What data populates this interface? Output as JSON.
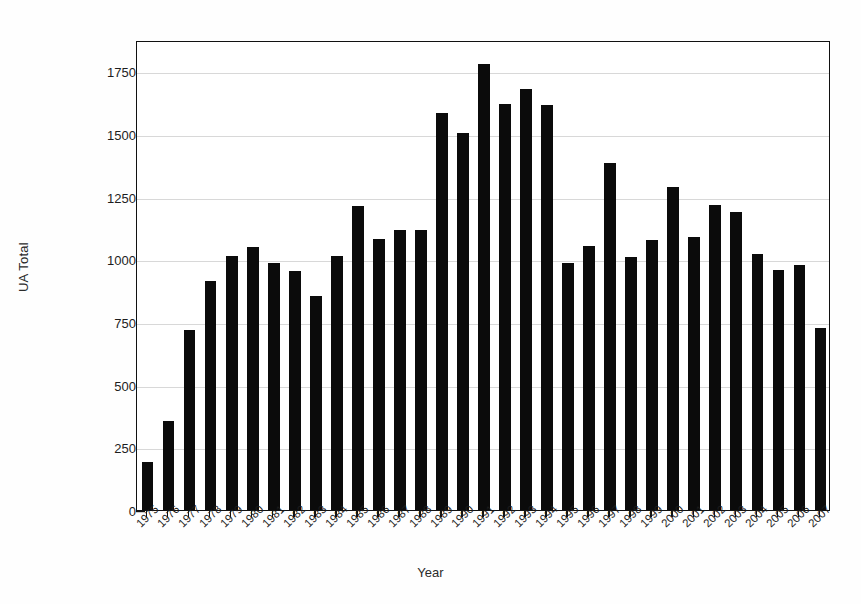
{
  "chart_data": {
    "type": "bar",
    "title": "",
    "xlabel": "Year",
    "ylabel": "UA Total",
    "categories": [
      "1975",
      "1976",
      "1977",
      "1978",
      "1979",
      "1980",
      "1981",
      "1982",
      "1983",
      "1984",
      "1985",
      "1986",
      "1987",
      "1988",
      "1989",
      "1990",
      "1991",
      "1992",
      "1993",
      "1994",
      "1995",
      "1996",
      "1997",
      "1998",
      "1999",
      "2000",
      "2001",
      "2002",
      "2003",
      "2004",
      "2005",
      "2006",
      "2007"
    ],
    "values": [
      190,
      356,
      718,
      912,
      1015,
      1048,
      985,
      953,
      855,
      1015,
      1213,
      1082,
      1118,
      1118,
      1582,
      1503,
      1778,
      1620,
      1680,
      1617,
      986,
      1055,
      1385,
      1010,
      1078,
      1288,
      1088,
      1215,
      1188,
      1020,
      958,
      978,
      725
    ],
    "ylim": [
      0,
      1875
    ],
    "yticks": [
      0,
      250,
      500,
      750,
      1000,
      1250,
      1500,
      1750
    ],
    "ytick_labels": [
      "0",
      "250",
      "500",
      "750",
      "1000",
      "1250",
      "1500",
      "1750"
    ],
    "grid": true,
    "legend": null,
    "bar_color": "#0b0b0b",
    "grid_color": "#d8d8d8",
    "axis_color": "#111111",
    "background": "#ffffff"
  }
}
